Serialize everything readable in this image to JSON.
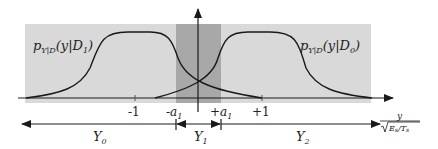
{
  "colors": {
    "background": "#ffffff",
    "region_fill": "#d9d9d9",
    "band_fill": "#a8a8a8",
    "curve": "#1a1a1a",
    "axis": "#1a1a1a"
  },
  "curves": {
    "left_label": {
      "p": "p",
      "sub": "Y|D",
      "arg": "(y|D",
      "argsub": "1",
      "close": ")"
    },
    "right_label": {
      "p": "p",
      "sub": "Y|D",
      "arg": "(y|D",
      "argsub": "0",
      "close": ")"
    }
  },
  "ticks": {
    "minus_one": "-1",
    "plus_one": "+1",
    "minus_a": {
      "sign": "-a",
      "sub": "1"
    },
    "plus_a": {
      "sign": "+a",
      "sub": "1"
    }
  },
  "regions": {
    "y0": {
      "main": "Y",
      "sub": "0"
    },
    "y1": {
      "main": "Y",
      "sub": "1"
    },
    "y2": {
      "main": "Y",
      "sub": "2"
    }
  },
  "axis_label": {
    "numerator": "y",
    "denominator": "E",
    "den_sub1": "s",
    "den_slash": "/T",
    "den_sub2": "s"
  }
}
